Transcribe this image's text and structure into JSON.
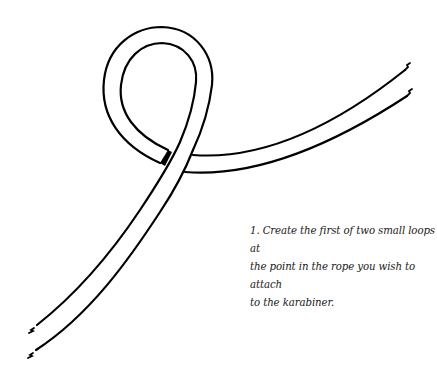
{
  "figure": {
    "step_number": "1.",
    "caption": "1. Create the first of two small loops at the point in the rope you wish to attach to the karabiner.",
    "caption_lines": [
      "1. Create the first of two small loops at",
      "the point in the rope you wish to attach",
      "to the karabiner."
    ],
    "colors": {
      "line": "#000000",
      "background": "#ffffff",
      "text": "#1a1a1a"
    }
  }
}
